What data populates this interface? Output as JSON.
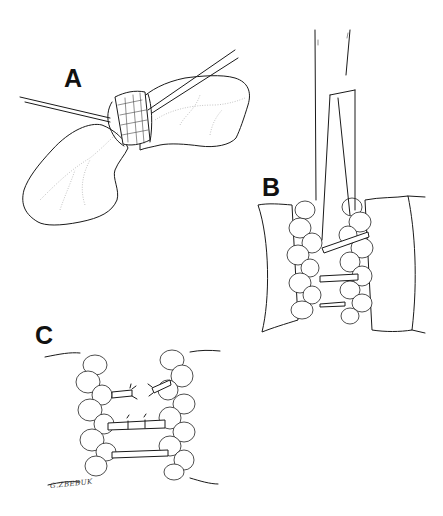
{
  "figure": {
    "type": "surgical line illustration",
    "background": "#ffffff",
    "ink_color": "#1a1a1a",
    "panels": [
      {
        "id": "A",
        "label": "A",
        "description": "bowel segment with mesentery encircled and retracted by two instruments"
      },
      {
        "id": "B",
        "label": "B",
        "description": "forceps spreading mesenteric fat exposing vessels between bowel walls"
      },
      {
        "id": "C",
        "label": "C",
        "description": "vessels ligated and divided between mesenteric fat pads"
      }
    ],
    "signature": "G.ZBEBUK"
  }
}
